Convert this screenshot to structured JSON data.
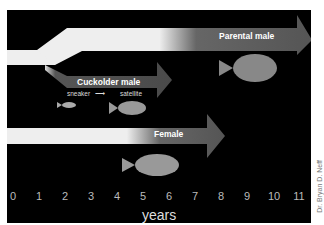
{
  "diagram": {
    "arrows": [
      {
        "label": "Parental male",
        "start_year": 1,
        "end_year": 11
      },
      {
        "label": "Cuckolder male",
        "start_year": 2,
        "end_year": 6,
        "stages": {
          "from": "sneaker",
          "to": "satellite"
        }
      },
      {
        "label": "Female",
        "start_year": 0,
        "end_year": 8
      }
    ],
    "axis": {
      "label": "years",
      "ticks": [
        "0",
        "1",
        "2",
        "3",
        "4",
        "5",
        "6",
        "7",
        "8",
        "9",
        "10",
        "11"
      ]
    },
    "credit": "Dr. Bryan D. Neff",
    "colors": {
      "background": "#000000",
      "arrow_light": "#e8e8e8",
      "arrow_dark": "#5a5a5a"
    }
  }
}
